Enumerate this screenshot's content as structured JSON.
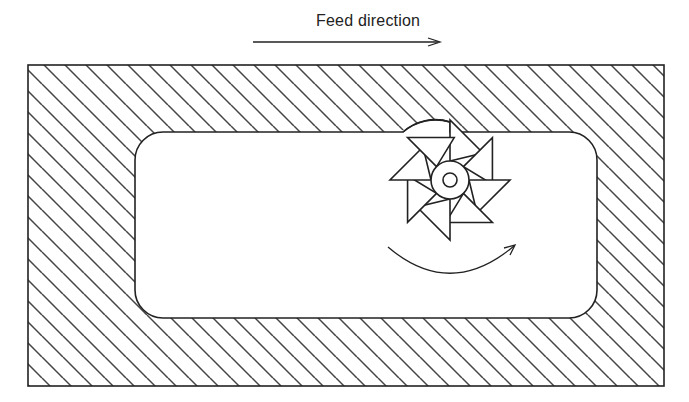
{
  "figure": {
    "feed_label": "Feed direction",
    "components": [
      "feed-direction-arrow",
      "workpiece",
      "pocket",
      "milling-cutter",
      "rotation-arrow"
    ],
    "cutter_teeth": 8,
    "colors": {
      "line": "#222222",
      "hatch": "#444444",
      "background": "#ffffff"
    }
  }
}
